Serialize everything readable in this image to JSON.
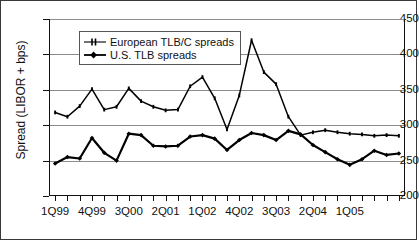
{
  "figure": {
    "background_color": "#ffffff",
    "frame_color": "#3a3a3a",
    "axis_color": "#111111",
    "grid_color": "#8c8c8c",
    "series_color": "#000000"
  },
  "legend": {
    "position": "top-left-inside",
    "entries": [
      {
        "label": "European TLB/C spreads",
        "marker": "plus-tick-marker",
        "line": "thin"
      },
      {
        "label": "U.S. TLB spreads",
        "marker": "filled-diamond-marker",
        "line": "thick"
      }
    ]
  },
  "caption": {
    "text": ""
  },
  "chart_data": {
    "type": "line",
    "title": "",
    "subtitle": "",
    "xlabel": "",
    "ylabel": "Spread (LIBOR + bps)",
    "ylim": [
      200,
      450
    ],
    "ytick_values": [
      200,
      250,
      300,
      350,
      400,
      450
    ],
    "ytick_labels": [
      "200",
      "250",
      "300",
      "350",
      "400",
      "450"
    ],
    "grid": "horizontal",
    "legend_position": "upper left",
    "x": [
      "1Q99",
      "2Q99",
      "3Q99",
      "4Q99",
      "1Q00",
      "2Q00",
      "3Q00",
      "4Q00",
      "1Q01",
      "2Q01",
      "3Q01",
      "4Q01",
      "1Q02",
      "2Q02",
      "3Q02",
      "4Q02",
      "1Q03",
      "2Q03",
      "3Q03",
      "4Q03",
      "1Q04",
      "2Q04",
      "3Q04",
      "4Q04",
      "1Q05",
      "2Q05",
      "3Q05",
      "4Q05",
      "1Q06"
    ],
    "xtick_labels_shown": [
      "1Q99",
      "4Q99",
      "3Q00",
      "2Q01",
      "1Q02",
      "4Q02",
      "3Q03",
      "2Q04",
      "1Q05"
    ],
    "xtick_label_interval": 3,
    "series": [
      {
        "name": "European TLB/C spreads",
        "values": [
          318,
          312,
          327,
          351,
          322,
          326,
          352,
          334,
          326,
          321,
          322,
          355,
          368,
          338,
          294,
          342,
          420,
          375,
          358,
          312,
          286,
          290,
          293,
          290,
          288,
          287,
          285,
          286,
          285
        ]
      },
      {
        "name": "U.S. TLB spreads",
        "values": [
          246,
          255,
          253,
          282,
          261,
          250,
          288,
          286,
          271,
          270,
          271,
          284,
          286,
          281,
          265,
          279,
          289,
          286,
          279,
          292,
          287,
          272,
          262,
          252,
          244,
          252,
          264,
          258,
          260
        ]
      }
    ]
  }
}
